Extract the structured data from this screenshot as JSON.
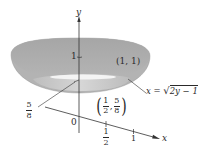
{
  "figure": {
    "type": "surface-of-revolution-diagram",
    "colors": {
      "surface_outer": "#a9a9a9",
      "surface_inner": "#c9c9c9",
      "surface_rim": "#b6b6b6",
      "hole": "#f2f2f2",
      "axis": "#333333",
      "text": "#2a2a2a"
    },
    "axes": {
      "y_label": "y",
      "x_label": "x",
      "origin_label": "0",
      "y_tick_1": "1",
      "x_tick_half": {
        "num": "1",
        "den": "2"
      },
      "x_tick_1": "1"
    },
    "annotations": {
      "point_top": "(1, 1)",
      "point_bottom": {
        "x_num": "1",
        "x_den": "2",
        "y_num": "5",
        "y_den": "8"
      },
      "y_level_label": {
        "num": "5",
        "den": "8"
      },
      "curve_equation": {
        "lhs": "x = ",
        "radical": "√",
        "radicand": "2y − 1"
      }
    }
  }
}
